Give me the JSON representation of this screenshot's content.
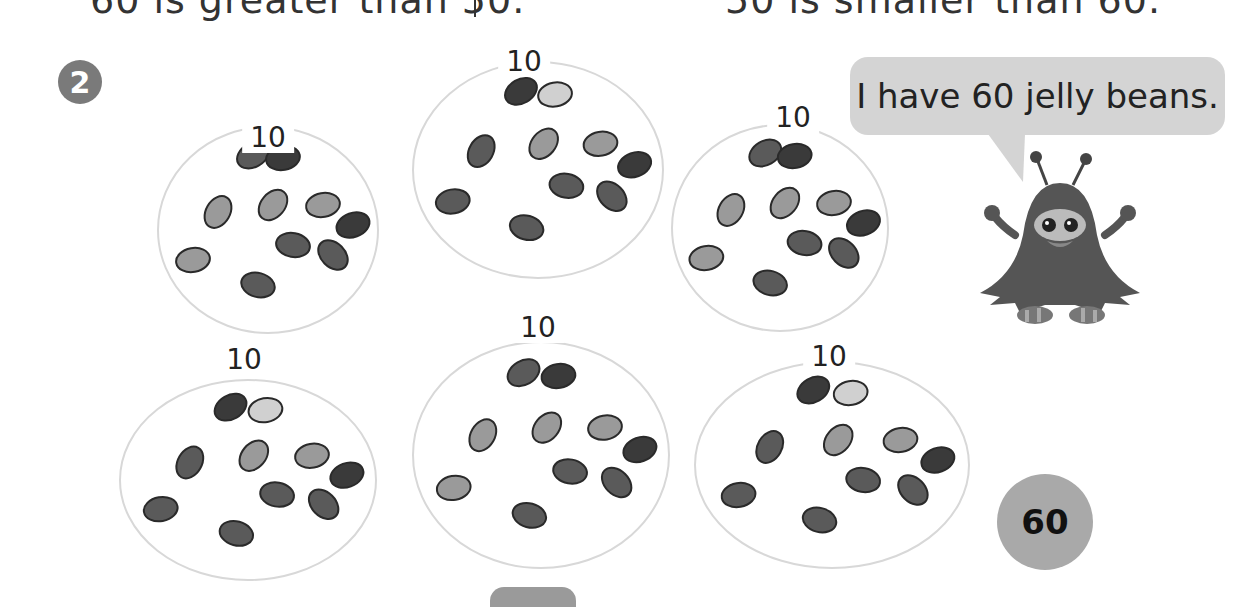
{
  "header": {
    "left_statement": "60 is greater than 50.",
    "right_statement": "50 is smaller than 60."
  },
  "problem": {
    "number": "2",
    "groups": [
      {
        "label": "10",
        "cx": 268,
        "cy": 230,
        "rx": 110,
        "ry": 103,
        "label_x": 268,
        "label_y": 138
      },
      {
        "label": "10",
        "cx": 538,
        "cy": 170,
        "rx": 125,
        "ry": 108,
        "label_x": 524,
        "label_y": 62
      },
      {
        "label": "10",
        "cx": 780,
        "cy": 228,
        "rx": 108,
        "ry": 103,
        "label_x": 793,
        "label_y": 118
      },
      {
        "label": "10",
        "cx": 248,
        "cy": 480,
        "rx": 128,
        "ry": 100,
        "label_x": 244,
        "label_y": 360
      },
      {
        "label": "10",
        "cx": 541,
        "cy": 455,
        "rx": 128,
        "ry": 113,
        "label_x": 538,
        "label_y": 328
      },
      {
        "label": "10",
        "cx": 832,
        "cy": 465,
        "rx": 137,
        "ry": 103,
        "label_x": 829,
        "label_y": 357
      }
    ],
    "beans_per_group": 10,
    "speech_bubble": "I have 60 jelly beans.",
    "answer": "60"
  },
  "colors": {
    "badge": "#7a7a7a",
    "bubble": "#d4d4d4",
    "answer_circle": "#a9a9a9",
    "circle_outline": "#d8d8d8",
    "bean_dark": "#3a3a3a",
    "bean_mid": "#5a5a5a",
    "bean_light": "#9a9a9a",
    "bean_pale": "#d0d0d0",
    "monster": "#555555"
  }
}
